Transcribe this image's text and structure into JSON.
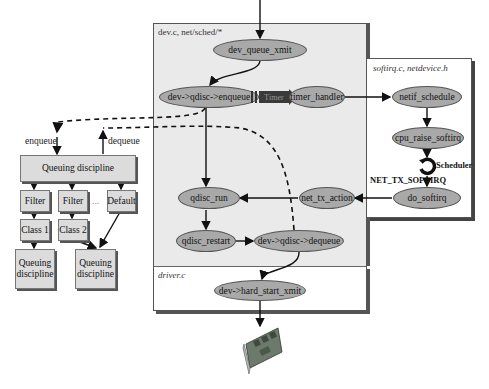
{
  "panels": {
    "main": {
      "label": "dev.c, net/sched/*"
    },
    "softirq": {
      "label": "softirq.c, netdevice.h"
    },
    "driver": {
      "label": "driver.c"
    }
  },
  "nodes": {
    "dev_queue_xmit": "dev_queue_xmit",
    "enqueue": "dev->qdisc->enqueue",
    "timer_handler": "timer_handler",
    "netif_schedule": "netif_schedule",
    "cpu_raise_softirq": "cpu_raise_softirq",
    "do_softirq": "do_softirq",
    "net_tx_action": "net_tx_action",
    "qdisc_run": "qdisc_run",
    "qdisc_restart": "qdisc_restart",
    "dequeue": "dev->qdisc->dequeue",
    "hard_start_xmit": "dev->hard_start_xmit"
  },
  "timer": {
    "label": "Timer",
    "color": "#3a3a3a"
  },
  "scheduler": {
    "label": "Scheduler"
  },
  "softirq_label": "NET_TX_SOFTIRQ",
  "qdisc_tree": {
    "enqueue_label": "enqueue",
    "dequeue_label": "dequeue",
    "root": "Queuing discipline",
    "filters": [
      "Filter",
      "Filter"
    ],
    "ellipsis": "...",
    "default": "Default",
    "classes": [
      "Class 1",
      "Class 2"
    ],
    "children": [
      "Queuing discipline",
      "Queuing discipline"
    ]
  },
  "colors": {
    "main_panel_bg": "#eaeaea",
    "node_fill": "#a9a9a9",
    "box_fill": "#dcdcdc"
  }
}
